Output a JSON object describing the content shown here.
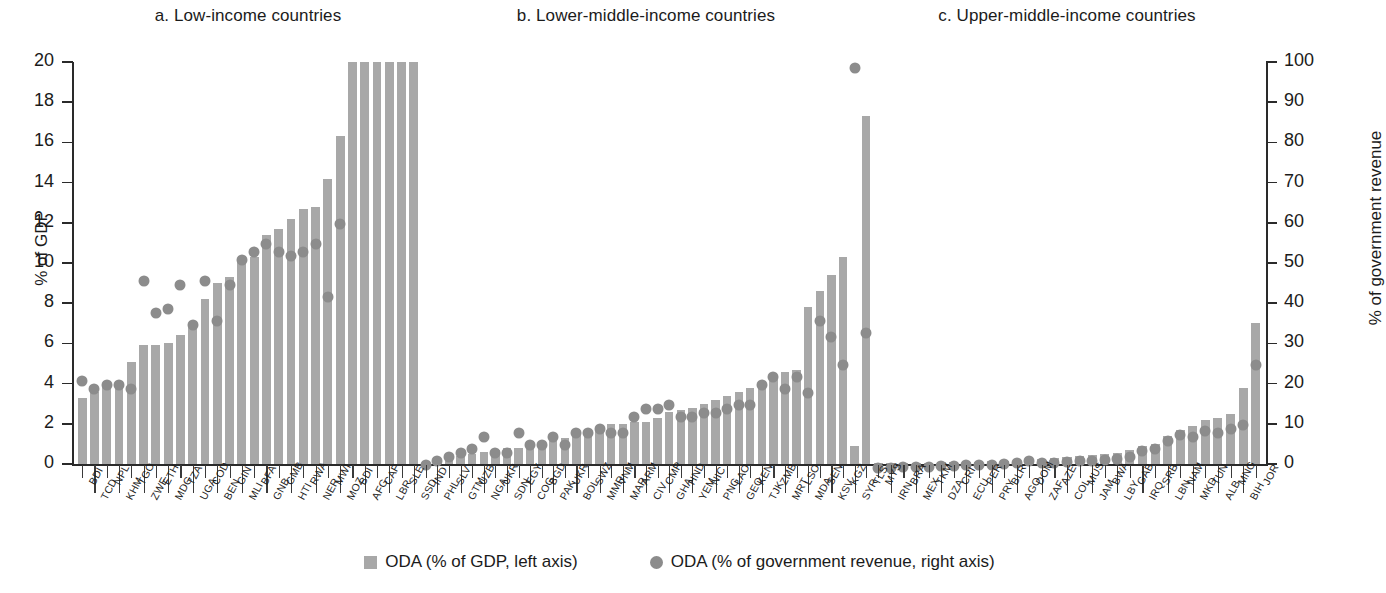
{
  "chart_data": {
    "type": "bar",
    "grid": false,
    "legend_position": "bottom",
    "ylabel": "% of GDP",
    "ylabel_right": "% of government revenue",
    "xlabel": "",
    "ylim": [
      0,
      20
    ],
    "ylim_right": [
      0,
      100
    ],
    "yticks": [
      0,
      2,
      4,
      6,
      8,
      10,
      12,
      14,
      16,
      18,
      20
    ],
    "yticks_right": [
      0,
      10,
      20,
      30,
      40,
      50,
      60,
      70,
      80,
      90,
      100
    ],
    "series": [
      {
        "name": "ODA (% of GDP, left axis)",
        "type": "bar",
        "color": "#a8a8a8",
        "axis": "left"
      },
      {
        "name": "ODA (% of government revenue, right axis)",
        "type": "scatter",
        "color": "#8c8c8c",
        "axis": "right"
      }
    ],
    "panels": [
      {
        "key": "a",
        "title": "a. Low-income countries",
        "categories": [
          "BDI",
          "TCD",
          "NPL",
          "KHM",
          "TGO",
          "ZWE",
          "ETH",
          "MDG",
          "TZA",
          "UGA",
          "COD",
          "BEN",
          "GIN",
          "MLI",
          "BFA",
          "GNB",
          "GMB",
          "HTI",
          "RWA",
          "NER",
          "MWI",
          "MOZ",
          "BDI2",
          "AFG",
          "CAF",
          "LBR",
          "SLE",
          "SSD"
        ],
        "bar_values": [
          3.3,
          3.6,
          4.0,
          4.1,
          5.1,
          5.9,
          5.9,
          6.0,
          6.4,
          7.0,
          8.2,
          9.0,
          9.3,
          10.1,
          10.3,
          11.4,
          11.7,
          12.2,
          12.7,
          12.8,
          14.2,
          16.3,
          20.0,
          20.0,
          20.0,
          20.0,
          20.0,
          20.0
        ],
        "dot_values": [
          22,
          20,
          21,
          21,
          20,
          47,
          39,
          40,
          46,
          36,
          47,
          37,
          46,
          52,
          54,
          56,
          54,
          53,
          54,
          56,
          43,
          61,
          null,
          null,
          null,
          null,
          null,
          null
        ]
      },
      {
        "key": "b",
        "title": "b. Lower-middle-income countries",
        "categories": [
          "IND",
          "PHL",
          "SLV",
          "GTM",
          "UZB",
          "NGA",
          "UKR",
          "SDN",
          "EGY",
          "COG",
          "BGD",
          "PAK",
          "UKR2",
          "BOL",
          "SWZ",
          "MMR",
          "VNM",
          "MAR",
          "ARM",
          "CIV",
          "CMR",
          "GHA",
          "HND",
          "YEM",
          "NIC",
          "PNG",
          "LAO",
          "GEO",
          "KEN",
          "TJK",
          "ZMB",
          "MRT",
          "LSO",
          "MDA",
          "SEN",
          "KSV",
          "KGZ",
          "SYR",
          "TLS"
        ],
        "bar_values": [
          0.1,
          0.2,
          0.3,
          0.4,
          0.5,
          0.6,
          0.7,
          0.8,
          0.8,
          1.0,
          1.1,
          1.2,
          1.3,
          1.5,
          1.6,
          1.8,
          2.0,
          2.0,
          2.1,
          2.1,
          2.3,
          2.6,
          2.7,
          2.8,
          3.0,
          3.2,
          3.4,
          3.6,
          3.8,
          4.0,
          4.3,
          4.6,
          4.7,
          7.8,
          8.6,
          9.4,
          10.3,
          0.9,
          17.3
        ],
        "dot_values": [
          1,
          2,
          3,
          4,
          5,
          8,
          4,
          4,
          9,
          6,
          6,
          8,
          6,
          9,
          9,
          10,
          9,
          9,
          13,
          15,
          15,
          16,
          13,
          13,
          14,
          14,
          15,
          16,
          16,
          21,
          23,
          20,
          23,
          19,
          37,
          33,
          26,
          100,
          34
        ]
      },
      {
        "key": "c",
        "title": "c. Upper-middle-income countries",
        "categories": [
          "MYS",
          "IRN",
          "BRA",
          "MEX",
          "TKM",
          "DZA",
          "CRI",
          "ECU",
          "PER",
          "PRY",
          "BLR",
          "AGO",
          "DOM",
          "ZAF",
          "AZE",
          "COL",
          "MUS",
          "JAM",
          "BWA",
          "LBY",
          "GAB",
          "IRQ",
          "SRB",
          "LBN",
          "NAM",
          "MKD",
          "TUN",
          "ALB",
          "MNG",
          "BIH",
          "JOR"
        ],
        "bar_values": [
          0.03,
          0.04,
          0.05,
          0.06,
          0.07,
          0.08,
          0.09,
          0.1,
          0.12,
          0.14,
          0.15,
          0.17,
          0.2,
          0.25,
          0.3,
          0.35,
          0.4,
          0.45,
          0.5,
          0.55,
          0.7,
          0.9,
          1.0,
          1.4,
          1.7,
          1.9,
          2.2,
          2.3,
          2.5,
          3.8,
          7.0
        ],
        "dot_values": [
          0.3,
          0.4,
          0.5,
          0.6,
          0.7,
          0.8,
          0.9,
          1.0,
          1.1,
          1.2,
          1.3,
          1.5,
          2.0,
          1.6,
          1.7,
          1.8,
          2.0,
          2.2,
          2.4,
          2.6,
          3.0,
          4.5,
          5.0,
          7.0,
          8.5,
          8.0,
          9.5,
          9.0,
          10.0,
          11.0,
          26.0
        ]
      }
    ],
    "panel_x_labels": {
      "a_top": [
        "BDI",
        "NPL",
        "TGO",
        "ETH",
        "TZA",
        "COD",
        "GIN",
        "BFA",
        "GMB",
        "RWA",
        "MWI",
        "BDI",
        "CAF",
        "SLE"
      ],
      "a_bottom": [
        "TCD",
        "KHM",
        "ZWE",
        "MDG",
        "UGA",
        "BEN",
        "MLI",
        "GNB",
        "HTI",
        "NER",
        "MOZ",
        "AFG",
        "LBR",
        "SSD"
      ],
      "b_top": [
        "IND",
        "SLV",
        "UZB",
        "UKR",
        "EGY",
        "BGD",
        "UKR",
        "SWZ",
        "VNM",
        "ARM",
        "CMR",
        "HND",
        "NIC",
        "LAO",
        "KEN",
        "ZMB",
        "LSO",
        "SEN",
        "KGZ",
        "TLS"
      ],
      "b_bottom": [
        "PHL",
        "GTM",
        "NGA",
        "SDN",
        "COG",
        "PAK",
        "BOL",
        "MMR",
        "MAR",
        "CIV",
        "GHA",
        "YEM",
        "PNG",
        "GEO",
        "TJK",
        "MRT",
        "MDA",
        "KSV",
        "SYR"
      ],
      "c_top": [
        "MYS",
        "BRA",
        "TKM",
        "CRI",
        "PER",
        "BLR",
        "DOM",
        "AZE",
        "MUS",
        "BWA",
        "GAB",
        "SRB",
        "NAM",
        "TUN",
        "MNG",
        "JOR"
      ],
      "c_bottom": [
        "IRN",
        "MEX",
        "DZA",
        "ECU",
        "PRY",
        "AGO",
        "ZAF",
        "COL",
        "JAM",
        "LBY",
        "IRQ",
        "LBN",
        "MKD",
        "ALB",
        "BIH"
      ]
    }
  },
  "legend": {
    "items": [
      {
        "label": "ODA (% of GDP, left axis)",
        "marker": "square-swatch-icon"
      },
      {
        "label": "ODA (% of government revenue, right axis)",
        "marker": "circle-swatch-icon"
      }
    ]
  },
  "colors": {
    "bar": "#a8a8a8",
    "dot": "#8c8c8c",
    "axis": "#2a2a2a",
    "text": "#1b1b1b",
    "background": "#ffffff"
  }
}
